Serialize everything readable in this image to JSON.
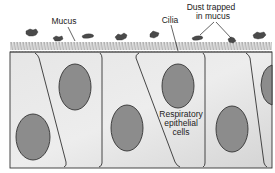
{
  "diagram": {
    "labels": {
      "mucus": "Mucus",
      "cilia": "Cilia",
      "dust_line1": "Dust trapped",
      "dust_line2": "in mucus",
      "cells_line1": "Respiratory",
      "cells_line2": "epithelial",
      "cells_line3": "cells"
    },
    "colors": {
      "cell_fill": "#dcdcdc",
      "cell_fill_light": "#ebebeb",
      "nucleus_fill": "#8c8c8c",
      "outline": "#333333",
      "cilia": "#777777",
      "dust": "#4a4a4a",
      "text": "#222222"
    },
    "structures": {
      "cilia_band": "cilia",
      "cell_count_visible": 6,
      "nucleus_count_visible": 6,
      "dust_particle_count": 9
    }
  }
}
